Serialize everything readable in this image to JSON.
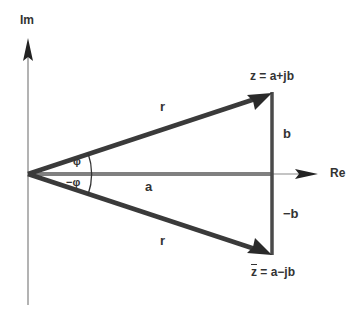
{
  "diagram": {
    "axes": {
      "imaginary_label": "Im",
      "real_label": "Re"
    },
    "vectors": {
      "z": {
        "label": "z = a+jb",
        "magnitude_label": "r"
      },
      "conjugate": {
        "label_bar": "z",
        "label_rest": " = a−jb",
        "magnitude_label": "r"
      }
    },
    "segments": {
      "real_part": "a",
      "imag_positive": "b",
      "imag_negative": "−b"
    },
    "angles": {
      "positive": "φ",
      "negative": "−φ"
    },
    "colors": {
      "vector": "#3a3a3a",
      "axis": "#8a8a8a",
      "real_segment": "#808080",
      "text": "#333333"
    }
  }
}
